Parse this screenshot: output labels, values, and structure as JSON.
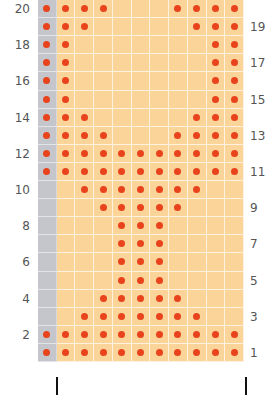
{
  "chart": {
    "title": "",
    "rows": 20,
    "columns": 11,
    "edge_column_index": 0,
    "colors": {
      "cell": "#fbd49a",
      "edge_cell": "#c4c6cb",
      "grid_line": "#fff3e0",
      "stitch_dot": "#e8431c",
      "label": "#555555",
      "marker": "#111111"
    },
    "row_labels_left": [
      "20",
      "18",
      "16",
      "14",
      "12",
      "10",
      "8",
      "6",
      "4",
      "2"
    ],
    "row_labels_right": [
      "19",
      "17",
      "15",
      "13",
      "11",
      "9",
      "7",
      "5",
      "3",
      "1"
    ],
    "pattern_rows": {
      "20": [
        0,
        1,
        2,
        3,
        7,
        8,
        9,
        10
      ],
      "19": [
        0,
        1,
        2,
        8,
        9,
        10
      ],
      "18": [
        0,
        1,
        9,
        10
      ],
      "17": [
        0,
        1,
        9,
        10
      ],
      "16": [
        0,
        1,
        9,
        10
      ],
      "15": [
        0,
        1,
        9,
        10
      ],
      "14": [
        0,
        1,
        2,
        8,
        9,
        10
      ],
      "13": [
        0,
        1,
        2,
        3,
        7,
        8,
        9,
        10
      ],
      "12": [
        0,
        1,
        2,
        3,
        4,
        5,
        6,
        7,
        8,
        9,
        10
      ],
      "11": [
        0,
        1,
        2,
        3,
        4,
        5,
        6,
        7,
        8,
        9,
        10
      ],
      "10": [
        2,
        3,
        4,
        5,
        6,
        7,
        8
      ],
      "9": [
        3,
        4,
        5,
        6,
        7
      ],
      "8": [
        4,
        5,
        6
      ],
      "7": [
        4,
        5,
        6
      ],
      "6": [
        4,
        5,
        6
      ],
      "5": [
        4,
        5,
        6
      ],
      "4": [
        3,
        4,
        5,
        6,
        7
      ],
      "3": [
        2,
        3,
        4,
        5,
        6,
        7,
        8
      ],
      "2": [
        0,
        1,
        2,
        3,
        4,
        5,
        6,
        7,
        8,
        9,
        10
      ],
      "1": [
        0,
        1,
        2,
        3,
        4,
        5,
        6,
        7,
        8,
        9,
        10
      ]
    },
    "repeat_markers": [
      {
        "x": 57
      },
      {
        "x": 246
      }
    ]
  }
}
